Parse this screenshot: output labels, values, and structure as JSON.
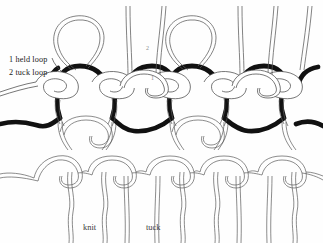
{
  "figure": {
    "type": "knitted-loop-structure-diagram",
    "background_color": "#fefefe",
    "yarn_colors": {
      "held_loop_dark": "#111111",
      "tuck_loop_light": "#ffffff",
      "outline": "#4a4a4a"
    }
  },
  "legend": {
    "held_loop_label": "1 held loop",
    "tuck_loop_label": "2 tuck loop"
  },
  "markers": {
    "tuck_marker": "2",
    "held_marker": "1"
  },
  "columns": {
    "knit_label": "knit",
    "tuck_label": "tuck"
  }
}
